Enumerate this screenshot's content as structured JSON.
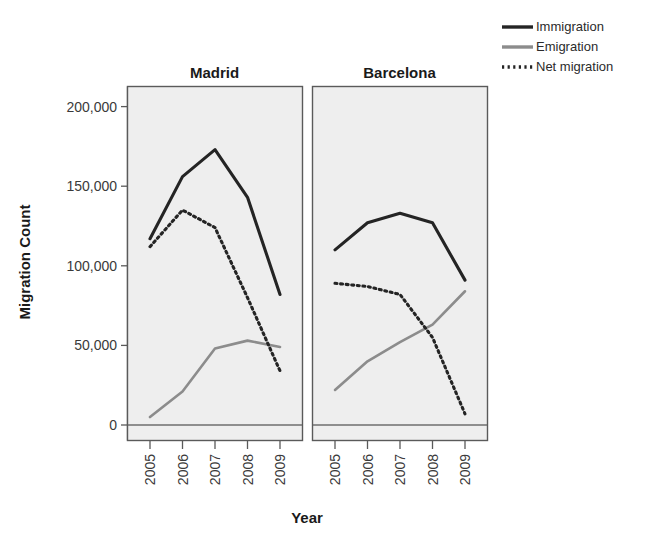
{
  "chart_data": {
    "type": "line",
    "title": "",
    "xlabel": "Year",
    "ylabel": "Migration Count",
    "x": [
      2005,
      2006,
      2007,
      2008,
      2009
    ],
    "xtick_labels": [
      "2005",
      "2006",
      "2007",
      "2008",
      "2009"
    ],
    "ytick_labels": [
      "0",
      "50,000",
      "100,000",
      "150,000",
      "200,000"
    ],
    "ytick_values": [
      0,
      50000,
      100000,
      150000,
      200000
    ],
    "ylim": [
      -8000,
      212000
    ],
    "grid": false,
    "legend_position": "top-right",
    "panel_titles": [
      "Madrid",
      "Barcelona"
    ],
    "panels": [
      {
        "name": "Madrid",
        "series": [
          {
            "name": "Immigration",
            "values": [
              117000,
              156000,
              173000,
              143000,
              82000
            ]
          },
          {
            "name": "Emigration",
            "values": [
              5000,
              21000,
              48000,
              53000,
              49000
            ]
          },
          {
            "name": "Net migration",
            "values": [
              112000,
              135000,
              124000,
              80000,
              34000
            ]
          }
        ]
      },
      {
        "name": "Barcelona",
        "series": [
          {
            "name": "Immigration",
            "values": [
              110000,
              127000,
              133000,
              127000,
              91000
            ]
          },
          {
            "name": "Emigration",
            "values": [
              22000,
              40000,
              52000,
              63000,
              84000
            ]
          },
          {
            "name": "Net migration",
            "values": [
              89000,
              87000,
              82000,
              55000,
              7000
            ]
          }
        ]
      }
    ],
    "legend": [
      {
        "label": "Immigration",
        "color": "#242424",
        "style": "solid"
      },
      {
        "label": "Emigration",
        "color": "#8c8c8c",
        "style": "solid"
      },
      {
        "label": "Net migration",
        "color": "#242424",
        "style": "dotted"
      }
    ]
  },
  "colors": {
    "immigration": "#242424",
    "emigration": "#8c8c8c",
    "net_migration": "#242424",
    "panel_background": "#eeeeee",
    "panel_border": "#5a5a5a",
    "page_background": "#ffffff",
    "text": "#1a1a1a"
  },
  "labels": {
    "ylabel": "Migration Count",
    "xlabel": "Year",
    "panel_madrid": "Madrid",
    "panel_barcelona": "Barcelona",
    "legend_immigration": "Immigration",
    "legend_emigration": "Emigration",
    "legend_net_migration": "Net migration",
    "ytick_0": "0",
    "ytick_50k": "50,000",
    "ytick_100k": "100,000",
    "ytick_150k": "150,000",
    "ytick_200k": "200,000",
    "xtick_2005": "2005",
    "xtick_2006": "2006",
    "xtick_2007": "2007",
    "xtick_2008": "2008",
    "xtick_2009": "2009"
  }
}
